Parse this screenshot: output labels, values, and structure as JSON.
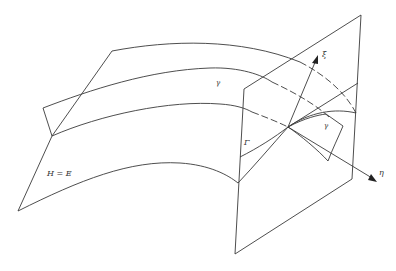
{
  "diagram": {
    "labels": {
      "surface": "H = E",
      "curve_main": "γ",
      "curve_small": "γ",
      "intersection": "Γ",
      "axis_xi": "ξ",
      "axis_eta": "η"
    },
    "colors": {
      "stroke": "#3a3a3a",
      "background": "#ffffff"
    }
  }
}
